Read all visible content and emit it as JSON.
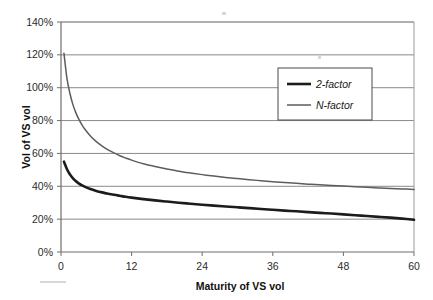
{
  "chart_data": {
    "type": "line",
    "title": "",
    "subtitle": "",
    "xlabel": "Maturity of VS vol",
    "ylabel": "Vol of VS vol",
    "xlim": [
      0,
      60
    ],
    "ylim": [
      0,
      1.4
    ],
    "grid": true,
    "grid_axis": "y",
    "legend_position": "upper-right",
    "y_tick_labels": [
      "0%",
      "20%",
      "40%",
      "60%",
      "80%",
      "100%",
      "120%",
      "140%"
    ],
    "y_tick_values": [
      0,
      0.2,
      0.4,
      0.6,
      0.8,
      1.0,
      1.2,
      1.4
    ],
    "x_tick_labels": [
      "0",
      "12",
      "24",
      "36",
      "48",
      "60"
    ],
    "x_tick_values": [
      0,
      12,
      24,
      36,
      48,
      60
    ],
    "series": [
      {
        "name": "2-factor",
        "color": "#1c1c1c",
        "line_width": 2.6,
        "x": [
          0.5,
          1,
          1.5,
          2,
          2.5,
          3,
          3.5,
          4,
          5,
          6,
          7,
          8,
          9,
          10,
          11,
          12,
          14,
          16,
          18,
          20,
          22,
          24,
          26,
          28,
          30,
          32,
          34,
          36,
          38,
          40,
          42,
          44,
          46,
          48,
          50,
          52,
          54,
          56,
          58,
          60
        ],
        "y": [
          0.55,
          0.505,
          0.473,
          0.45,
          0.432,
          0.418,
          0.407,
          0.398,
          0.383,
          0.372,
          0.363,
          0.355,
          0.348,
          0.342,
          0.336,
          0.331,
          0.322,
          0.314,
          0.307,
          0.3,
          0.294,
          0.288,
          0.282,
          0.277,
          0.272,
          0.267,
          0.262,
          0.257,
          0.252,
          0.248,
          0.243,
          0.238,
          0.234,
          0.229,
          0.224,
          0.219,
          0.214,
          0.209,
          0.203,
          0.196
        ]
      },
      {
        "name": "N-factor",
        "color": "#5d5d5d",
        "line_width": 1.5,
        "x": [
          0.5,
          1,
          1.5,
          2,
          2.5,
          3,
          3.5,
          4,
          5,
          6,
          7,
          8,
          9,
          10,
          11,
          12,
          14,
          16,
          18,
          20,
          22,
          24,
          26,
          28,
          30,
          32,
          34,
          36,
          38,
          40,
          42,
          44,
          46,
          48,
          50,
          52,
          54,
          56,
          58,
          60
        ],
        "y": [
          1.21,
          1.06,
          0.968,
          0.9,
          0.85,
          0.81,
          0.778,
          0.75,
          0.706,
          0.672,
          0.645,
          0.622,
          0.603,
          0.586,
          0.572,
          0.559,
          0.537,
          0.52,
          0.505,
          0.492,
          0.481,
          0.471,
          0.462,
          0.454,
          0.447,
          0.44,
          0.434,
          0.428,
          0.423,
          0.418,
          0.413,
          0.409,
          0.405,
          0.401,
          0.397,
          0.394,
          0.39,
          0.387,
          0.384,
          0.381
        ]
      }
    ],
    "legend_entries": [
      {
        "label": "2-factor",
        "color": "#1c1c1c",
        "line_width": 2.6
      },
      {
        "label": "N-factor",
        "color": "#5d5d5d",
        "line_width": 1.5
      }
    ]
  },
  "axes": {
    "y_title": "Vol of VS vol",
    "x_title": "Maturity of VS vol"
  },
  "legend": {
    "entry_0_label": "2-factor",
    "entry_1_label": "N-factor"
  },
  "ticks": {
    "y": [
      "0%",
      "20%",
      "40%",
      "60%",
      "80%",
      "100%",
      "120%",
      "140%"
    ],
    "x": [
      "0",
      "12",
      "24",
      "36",
      "48",
      "60"
    ]
  }
}
